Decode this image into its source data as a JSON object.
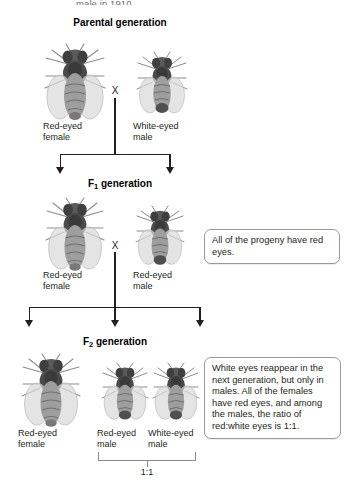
{
  "page": {
    "truncated_top_text": "male in 1910.",
    "background_color": "#ffffff",
    "text_color": "#231f20"
  },
  "headings": {
    "parental": "Parental generation",
    "f1_prefix": "F",
    "f1_sub": "1",
    "f1_suffix": " generation",
    "f2_prefix": "F",
    "f2_sub": "2",
    "f2_suffix": " generation"
  },
  "cross_symbol": "X",
  "generations": [
    {
      "id": "parental",
      "heading": "Parental generation",
      "individuals": [
        {
          "label": "Red-eyed\nfemale",
          "sex": "female",
          "eye_color": "red",
          "size": "large"
        },
        {
          "label": "White-eyed\nmale",
          "sex": "male",
          "eye_color": "white",
          "size": "small"
        }
      ]
    },
    {
      "id": "f1",
      "heading": "F1 generation",
      "individuals": [
        {
          "label": "Red-eyed\nfemale",
          "sex": "female",
          "eye_color": "red",
          "size": "large"
        },
        {
          "label": "Red-eyed\nmale",
          "sex": "male",
          "eye_color": "red",
          "size": "small"
        }
      ]
    },
    {
      "id": "f2",
      "heading": "F2 generation",
      "individuals": [
        {
          "label": "Red-eyed\nfemale",
          "sex": "female",
          "eye_color": "red",
          "size": "large"
        },
        {
          "label": "Red-eyed\nmale",
          "sex": "male",
          "eye_color": "red",
          "size": "small"
        },
        {
          "label": "White-eyed\nmale",
          "sex": "male",
          "eye_color": "white",
          "size": "small"
        }
      ]
    }
  ],
  "callouts": [
    {
      "id": "f1-callout",
      "text": "All of the progeny have red eyes."
    },
    {
      "id": "f2-callout",
      "text": "White eyes reappear in the next generation, but only in males. All of the females have red eyes, and among the males, the ratio of red:white eyes is 1:1."
    }
  ],
  "ratio": {
    "value": "1:1",
    "applies_to": "males"
  },
  "colors": {
    "line": "#231f20",
    "callout_border": "#9a9a9a",
    "bracket": "#8a8a8a",
    "fly_body_dark": "#4a4a4a",
    "fly_body_mid": "#7d7d7d",
    "fly_wing": "#d6d6d6"
  }
}
